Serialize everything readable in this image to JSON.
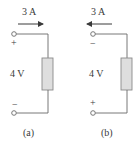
{
  "figure": {
    "panels": [
      {
        "id": "a",
        "current_label": "3 A",
        "current_direction": "right",
        "voltage_label": "4 V",
        "top_polarity": "+",
        "bottom_polarity": "−",
        "caption": "(a)"
      },
      {
        "id": "b",
        "current_label": "3 A",
        "current_direction": "left",
        "voltage_label": "4 V",
        "top_polarity": "−",
        "bottom_polarity": "+",
        "caption": "(b)"
      }
    ],
    "colors": {
      "wire": "#6a6a6a",
      "element_fill": "#dedede",
      "element_stroke": "#8a8a8a",
      "text": "#3a3a3a"
    }
  }
}
